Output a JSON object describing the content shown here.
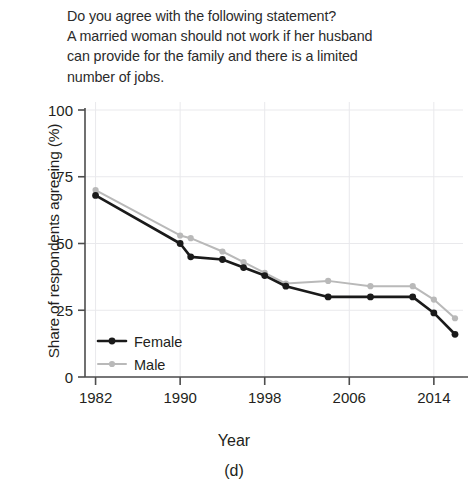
{
  "question": {
    "lines": [
      "Do you agree with the following statement?",
      "A married woman should not work if her husband",
      "can provide for the family and there is a limited",
      "number of jobs."
    ]
  },
  "axes": {
    "y_title": "Share of respondents agreeing (%)",
    "x_title": "Year",
    "panel_label": "(d)"
  },
  "legend": {
    "female": "Female",
    "male": "Male"
  },
  "colors": {
    "female": "#1a1a1a",
    "male": "#b9b9b9",
    "grid": "#e9e9ec",
    "axis": "#4d4d4d",
    "text": "#231f20"
  },
  "chart_data": {
    "type": "line",
    "title": "Do you agree with the following statement? A married woman should not work if her husband can provide for the family and there is a limited number of jobs.",
    "xlabel": "Year",
    "ylabel": "Share of respondents agreeing (%)",
    "panel": "(d)",
    "xlim": [
      1981,
      2016
    ],
    "ylim": [
      0,
      100
    ],
    "xticks": [
      1982,
      1990,
      1998,
      2006,
      2014
    ],
    "yticks": [
      0,
      25,
      50,
      75,
      100
    ],
    "xtick_labels": [
      "1982",
      "1990",
      "1998",
      "2006",
      "2014"
    ],
    "ytick_labels": [
      "0",
      "25",
      "50",
      "75",
      "100"
    ],
    "grid": true,
    "legend_position": "bottom-left",
    "series": [
      {
        "name": "Female",
        "color": "#1a1a1a",
        "x": [
          1982,
          1990,
          1991,
          1994,
          1996,
          1998,
          2000,
          2004,
          2008,
          2012,
          2014,
          2016
        ],
        "values": [
          68,
          50,
          45,
          44,
          41,
          38,
          34,
          30,
          30,
          30,
          24,
          16
        ]
      },
      {
        "name": "Male",
        "color": "#b9b9b9",
        "x": [
          1982,
          1990,
          1991,
          1994,
          1996,
          1998,
          2000,
          2004,
          2008,
          2012,
          2014,
          2016
        ],
        "values": [
          70,
          53,
          52,
          47,
          43,
          39,
          35,
          36,
          34,
          34,
          29,
          22
        ]
      }
    ]
  }
}
